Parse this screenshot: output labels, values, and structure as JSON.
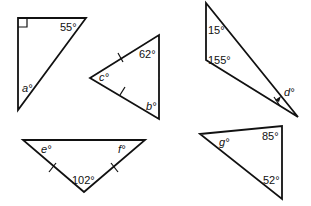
{
  "triangles": [
    {
      "id": "t1",
      "labels": {
        "known": "55°",
        "unknown": "a°"
      },
      "right_angle_marker": true,
      "angles": {
        "right": 90,
        "top_right": 55,
        "bottom": "a"
      }
    },
    {
      "id": "t2",
      "labels": {
        "known": "62°",
        "unknown_left": "c°",
        "unknown_bottom": "b°"
      },
      "isosceles_tick_marks": 2,
      "angles": {
        "top_right": 62,
        "left": "c",
        "bottom_right": "b"
      }
    },
    {
      "id": "t3",
      "labels": {
        "known_top": "15°",
        "known_mid": "155°",
        "unknown": "d°"
      },
      "angles": {
        "top": 15,
        "exterior_mid": 155,
        "bottom_right": "d"
      }
    },
    {
      "id": "t4",
      "labels": {
        "unknown_left": "e°",
        "unknown_right": "f°",
        "known": "102°"
      },
      "isosceles_tick_marks": 2,
      "angles": {
        "left": "e",
        "right": "f",
        "bottom": 102
      }
    },
    {
      "id": "t5",
      "labels": {
        "unknown": "g°",
        "known_top": "85°",
        "known_bottom": "52°"
      },
      "angles": {
        "left": "g",
        "top_right": 85,
        "bottom_right": 52
      }
    }
  ],
  "colors": {
    "line": "#111111",
    "background": "#ffffff"
  }
}
